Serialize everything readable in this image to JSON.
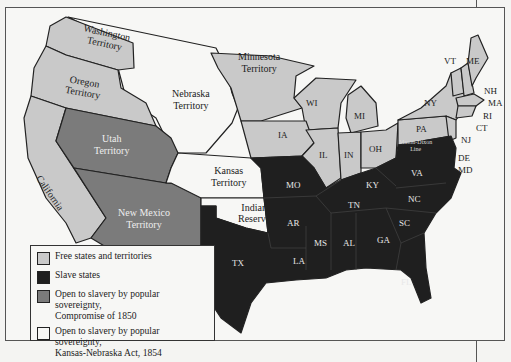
{
  "colors": {
    "free": "#c9c9c9",
    "slave": "#1f1f1f",
    "compromise_1850": "#7b7b7b",
    "kansas_nebraska": "#f7f7f5",
    "border": "#222222",
    "background": "#f7f7f5"
  },
  "regions": {
    "washington": "Washington",
    "washington2": "Territory",
    "oregon": "Oregon",
    "oregon2": "Territory",
    "nebraska": "Nebraska",
    "nebraska2": "Territory",
    "minnesota": "Minnesota",
    "minnesota2": "Territory",
    "utah": "Utah",
    "utah2": "Territory",
    "california": "California",
    "newmexico": "New Mexico",
    "newmexico2": "Territory",
    "kansas": "Kansas",
    "kansas2": "Territory",
    "indian": "Indian",
    "indian2": "Reserve",
    "wi": "WI",
    "mi": "MI",
    "ia": "IA",
    "il": "IL",
    "in": "IN",
    "oh": "OH",
    "pa": "PA",
    "ny": "NY",
    "vt": "VT",
    "me": "ME",
    "nh": "NH",
    "ma": "MA",
    "ri": "RI",
    "ct": "CT",
    "nj": "NJ",
    "de": "DE",
    "md": "MD",
    "mo": "MO",
    "ky": "KY",
    "va": "VA",
    "nc": "NC",
    "tn": "TN",
    "ar": "AR",
    "sc": "SC",
    "ga": "GA",
    "al": "AL",
    "ms": "MS",
    "la": "LA",
    "fl": "FL",
    "tx": "TX",
    "mason_dixon": "Mason-Dixon",
    "mason_dixon2": "Line"
  },
  "legend": {
    "items": [
      {
        "label": "Free states and territories",
        "color": "#c9c9c9"
      },
      {
        "label": "Slave states",
        "color": "#1f1f1f"
      },
      {
        "label": "Open to slavery by popular sovereignty,",
        "label2": "Compromise of 1850",
        "color": "#7b7b7b"
      },
      {
        "label": "Open to slavery by popular sovereignty,",
        "label2": "Kansas-Nebraska Act, 1854",
        "color": "#f7f7f5"
      }
    ]
  }
}
